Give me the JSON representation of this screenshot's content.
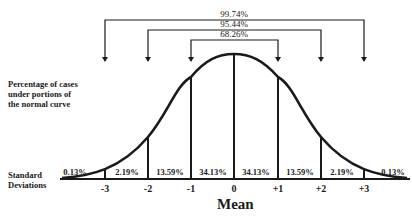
{
  "diagram": {
    "side_label_top": [
      "Percentage of cases",
      "under portions of",
      "the normal curve"
    ],
    "side_label_bottom": [
      "Standard",
      "Deviations"
    ],
    "axis_title": "Mean",
    "brackets": [
      {
        "label": "99.74%",
        "from": "-3",
        "to": "+3"
      },
      {
        "label": "95.44%",
        "from": "-2",
        "to": "+2"
      },
      {
        "label": "68.26%",
        "from": "-1",
        "to": "+1"
      }
    ],
    "ticks": [
      "-3",
      "-2",
      "-1",
      "0",
      "+1",
      "+2",
      "+3"
    ],
    "segments": [
      "0.13%",
      "2.19%",
      "13.59%",
      "34.13%",
      "34.13%",
      "13.59%",
      "2.19%",
      "0.13%"
    ],
    "colors": {
      "ink": "#1a1a1a",
      "background": "#ffffff"
    }
  }
}
